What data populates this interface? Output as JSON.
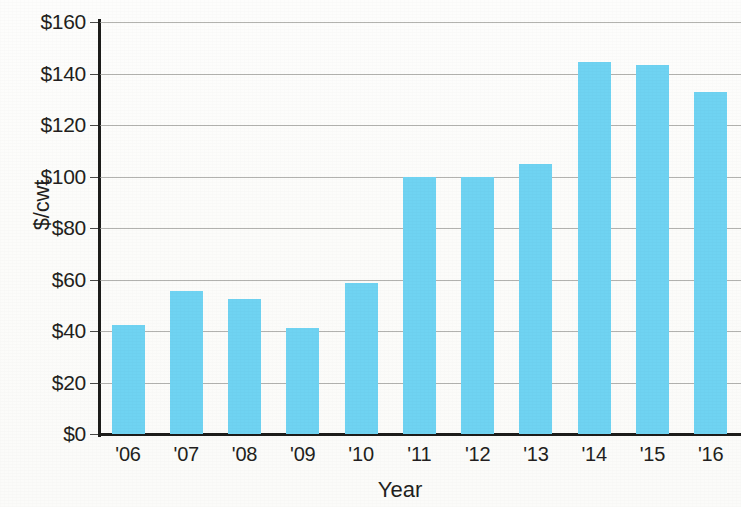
{
  "chart_data": {
    "type": "bar",
    "title": "",
    "categories": [
      "'06",
      "'07",
      "'08",
      "'09",
      "'10",
      "'11",
      "'12",
      "'13",
      "'14",
      "'15",
      "'16"
    ],
    "values": [
      42.5,
      55.5,
      52.5,
      41,
      58.5,
      100,
      100,
      105,
      144.5,
      143.5,
      133
    ],
    "xlabel": "Year",
    "ylabel": "$/cwt",
    "ylim": [
      0,
      160
    ],
    "ytick_step": 20,
    "ytick_labels": [
      "$0",
      "$20",
      "$40",
      "$60",
      "$80",
      "$100",
      "$120",
      "$140",
      "$160"
    ],
    "ytick_values": [
      0,
      20,
      40,
      60,
      80,
      100,
      120,
      140,
      160
    ],
    "grid": true,
    "grid_axis": "y",
    "legend": null,
    "legend_position": "none",
    "series": [
      {
        "name": "Price",
        "values": [
          42.5,
          55.5,
          52.5,
          41,
          58.5,
          100,
          100,
          105,
          144.5,
          143.5,
          133
        ]
      }
    ],
    "colors": {
      "bar": "#6fd3f2",
      "axis": "#1d1d1b",
      "grid": "#9a9a96",
      "text": "#231f20",
      "background": "#fdfdfb"
    }
  }
}
